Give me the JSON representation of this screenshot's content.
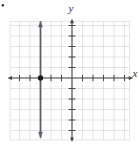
{
  "page": {
    "bullet": "•"
  },
  "chart_data": {
    "type": "line",
    "title": "",
    "equation": "x = -3",
    "xlabel": "x",
    "ylabel": "y",
    "xlim": [
      -5.9,
      5.5
    ],
    "ylim": [
      -5.9,
      5.4
    ],
    "tick_step": 1,
    "grid": true,
    "legend": false,
    "series": [
      {
        "name": "x = -3",
        "x": [
          -3,
          -3
        ],
        "y": [
          -5.7,
          5.4
        ],
        "arrows": "both",
        "color": "#5f5f6a"
      }
    ],
    "points": [
      {
        "x": -3,
        "y": 0,
        "color": "#1a1a1a"
      }
    ],
    "colors": {
      "grid": "#d8dade",
      "axis": "#474747",
      "labels": "#333333",
      "background": "#ffffff"
    }
  }
}
